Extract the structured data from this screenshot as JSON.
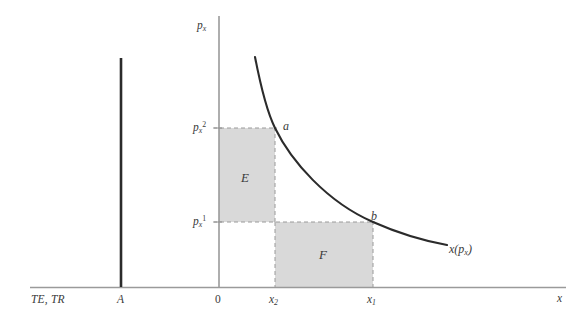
{
  "figure": {
    "type": "economics-demand-curve-diagram",
    "background_color": "#ffffff",
    "axes": {
      "y_axis_label": "p",
      "y_axis_label_sub": "x",
      "x_axis_label": "x",
      "origin_label": "0",
      "left_axis_label": "TE, TR",
      "budget_line_label": "A",
      "axis_color": "#8c8c8c",
      "budget_line_color": "#2b2b2b"
    },
    "y_ticks": [
      {
        "name": "p-x-2",
        "base": "p",
        "sub": "x",
        "sup": "2",
        "y_px": 128
      },
      {
        "name": "p-x-1",
        "base": "p",
        "sub": "x",
        "sup": "1",
        "y_px": 222
      }
    ],
    "x_ticks": [
      {
        "name": "x-2",
        "base": "x",
        "sub": "2",
        "x_px": 275
      },
      {
        "name": "x-1",
        "base": "x",
        "sub": "1",
        "x_px": 373
      }
    ],
    "points": [
      {
        "name": "point-a",
        "label": "a",
        "x_px": 275,
        "y_px": 128
      },
      {
        "name": "point-b",
        "label": "b",
        "x_px": 373,
        "y_px": 222
      }
    ],
    "regions": [
      {
        "name": "region-E",
        "label": "E",
        "fill": "#d9d9d9",
        "x": 219,
        "y": 128,
        "w": 56,
        "h": 94
      },
      {
        "name": "region-F",
        "label": "F",
        "fill": "#d9d9d9",
        "x": 275,
        "y": 222,
        "w": 98,
        "h": 65
      }
    ],
    "curve": {
      "name": "demand-curve",
      "label_base": "x",
      "label_arg_base": "p",
      "label_arg_sub": "x",
      "color": "#2b2b2b"
    }
  }
}
